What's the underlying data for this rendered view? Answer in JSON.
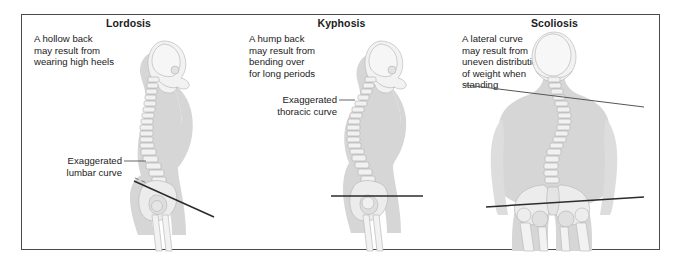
{
  "figure": {
    "name": "spinal-curvature-disorders",
    "border_color": "#4a4a4a",
    "background": "#ffffff"
  },
  "panels": [
    {
      "id": "lordosis",
      "title": "Lordosis",
      "description": "A hollow back\nmay result from\nwearing high heels",
      "callout": "Exaggerated\nlumbar curve",
      "view": "lateral profile, facing right",
      "reference_line": "tilted pelvic line",
      "figure_colors": {
        "body": "#d6d6d6",
        "bone": "#ececec",
        "line": "#2b2b2b"
      }
    },
    {
      "id": "kyphosis",
      "title": "Kyphosis",
      "description": "A hump back\nmay result from\nbending over\nfor long periods",
      "callout": "Exaggerated\nthoracic curve",
      "view": "lateral profile, facing right",
      "reference_line": "horizontal pelvic line",
      "figure_colors": {
        "body": "#d6d6d6",
        "bone": "#ececec",
        "line": "#2b2b2b"
      }
    },
    {
      "id": "scoliosis",
      "title": "Scoliosis",
      "description": "A lateral curve\nmay result from\nuneven distribution\nof weight when\nstanding",
      "callout": "",
      "view": "posterior, back view",
      "reference_line": "tilted shoulder line and tilted pelvic line",
      "figure_colors": {
        "body": "#d6d6d6",
        "bone": "#ececec",
        "line": "#2b2b2b"
      }
    }
  ]
}
